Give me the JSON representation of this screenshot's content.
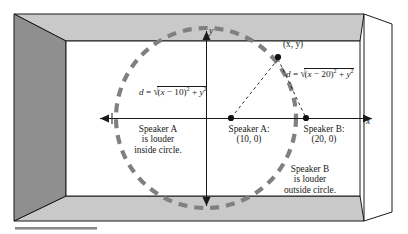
{
  "figure": {
    "name": "speaker-loudness-circle-diagram",
    "room": {
      "wall_left_color": "#8f8f8f",
      "ceiling_color": "#c9c9c9",
      "floor_color": "#c9c9c9",
      "back_wall_color": "#ffffff",
      "outline_color": "#1a1a1a"
    },
    "circle": {
      "color": "#808080",
      "style": "dashed",
      "center_label": "",
      "cx": 206,
      "cy": 118,
      "r": 90
    }
  },
  "axes": {
    "x_label": "x",
    "y_label": "y"
  },
  "points": [
    {
      "id": "point-xy",
      "label": "(x, y)",
      "x": 278,
      "y": 57
    },
    {
      "id": "point-speaker-a",
      "label": "(10, 0)",
      "x": 231,
      "y": 118
    },
    {
      "id": "point-speaker-b",
      "label": "(20, 0)",
      "x": 306,
      "y": 118
    }
  ],
  "labels": {
    "speaker_a_title": "Speaker A:",
    "speaker_a_coords": "(10, 0)",
    "speaker_b_title": "Speaker B:",
    "speaker_b_coords": "(20, 0)",
    "point_xy": "(x, y)",
    "note_inside_line1": "Speaker A",
    "note_inside_line2": "is louder",
    "note_inside_line3": "inside circle.",
    "note_outside_line1": "Speaker B",
    "note_outside_line2": "is louder",
    "note_outside_line3": "outside circle."
  },
  "formulas": {
    "distance_a": {
      "lhs": "d",
      "eq": "=",
      "radicand_pre": "(",
      "radicand_var": "x",
      "radicand_minus": " − ",
      "radicand_num": "10",
      "radicand_close": ")",
      "radicand_exp": "2",
      "plus": " + ",
      "y_var": "y",
      "y_exp": "2",
      "plain": "d = √((x − 10)² + y²)"
    },
    "distance_b": {
      "lhs": "d",
      "eq": "=",
      "radicand_pre": "(",
      "radicand_var": "x",
      "radicand_minus": " − ",
      "radicand_num": "20",
      "radicand_close": ")",
      "radicand_exp": "2",
      "plus": " + ",
      "y_var": "y",
      "y_exp": "2",
      "plain": "d = √((x − 20)² + y²)"
    }
  },
  "caption_rule": {
    "present": true,
    "color": "#8a8a8a"
  }
}
